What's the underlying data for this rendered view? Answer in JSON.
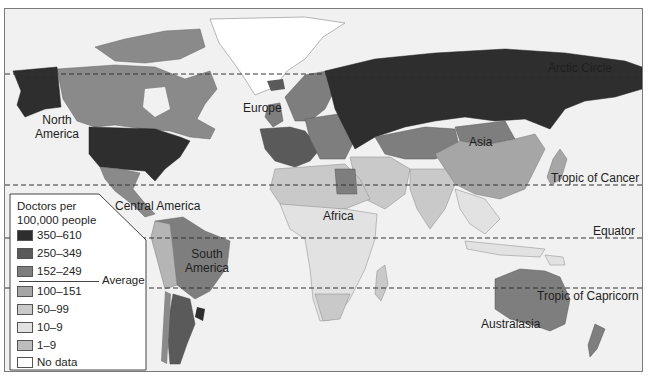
{
  "map": {
    "title": "Doctors per 100,000 people",
    "latitude_lines": [
      {
        "name": "Arctic Circle",
        "label": "Arctic Circle",
        "y": 73
      },
      {
        "name": "Tropic of Cancer",
        "label": "Tropic of Cancer",
        "y": 184
      },
      {
        "name": "Equator",
        "label": "Equator",
        "y": 237
      },
      {
        "name": "Tropic of Capricorn",
        "label": "Tropic of Capricorn",
        "y": 287
      }
    ],
    "regions": [
      {
        "name": "north-america",
        "label_line1": "North",
        "label_line2": "America"
      },
      {
        "name": "europe",
        "label": "Europe"
      },
      {
        "name": "asia",
        "label": "Asia"
      },
      {
        "name": "central-america",
        "label": "Central America"
      },
      {
        "name": "africa",
        "label": "Africa"
      },
      {
        "name": "south-america",
        "label_line1": "South",
        "label_line2": "America"
      },
      {
        "name": "australasia",
        "label": "Australasia"
      }
    ]
  },
  "legend": {
    "title_line1": "Doctors per",
    "title_line2": "100,000 people",
    "average_label": "Average",
    "items": [
      {
        "label": "350–610",
        "color": "#2e2e2e"
      },
      {
        "label": "250–349",
        "color": "#5a5a5a"
      },
      {
        "label": "152–249",
        "color": "#7e7e7e"
      },
      {
        "label": "100–151",
        "color": "#a6a6a6"
      },
      {
        "label": "50–99",
        "color": "#c9c9c9"
      },
      {
        "label": "10–9",
        "color": "#e2e2e2"
      },
      {
        "label": "1–9",
        "color": "#bdbdbd"
      },
      {
        "label": "No data",
        "color": "#ffffff"
      }
    ]
  }
}
